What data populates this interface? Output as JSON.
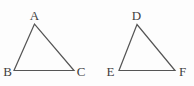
{
  "figure": {
    "background_color": "#fdfdfd",
    "line_color": "#555555",
    "label_color": "#3f3f3f",
    "triangles": [
      {
        "name": "ABC",
        "vertex_labels": {
          "top": "A",
          "bottom_left": "B",
          "bottom_right": "C"
        }
      },
      {
        "name": "DEF",
        "vertex_labels": {
          "top": "D",
          "bottom_left": "E",
          "bottom_right": "F"
        }
      }
    ]
  }
}
